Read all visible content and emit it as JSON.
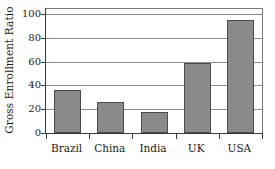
{
  "chart_data": {
    "type": "bar",
    "title": "",
    "subtitle": "",
    "xlabel": "",
    "ylabel": "Gross Enrollment Ratio",
    "categories": [
      "Brazil",
      "China",
      "India",
      "UK",
      "USA"
    ],
    "values": [
      36,
      26,
      18,
      59,
      95
    ],
    "ylim": [
      0,
      100
    ],
    "yticks": [
      0,
      20,
      40,
      60,
      80,
      100
    ],
    "ytick_labels": [
      "0",
      "20",
      "40",
      "60",
      "80",
      "100"
    ],
    "grid": true,
    "grid_axis": "y",
    "legend": false,
    "legend_position": "none",
    "bar_color": "#8a8a8a",
    "bar_edge_color": "#4a4a4a",
    "axis_color": "#3a3a3a",
    "gridline_color": "#8d8d8d",
    "frame_color": "#7a7a7a",
    "background_color": "#ffffff",
    "series": [
      {
        "name": "Gross Enrollment Ratio",
        "values": [
          36,
          26,
          18,
          59,
          95
        ]
      }
    ]
  }
}
